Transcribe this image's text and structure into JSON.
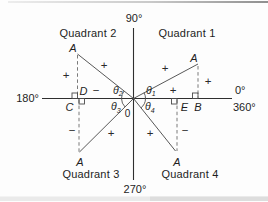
{
  "axes": {
    "top": "90°",
    "bottom": "270°",
    "left": "180°",
    "right_upper": "0°",
    "right_lower": "360°",
    "origin": "0"
  },
  "points": {
    "a": "A",
    "b": "B",
    "c": "C",
    "d": "D",
    "e": "E"
  },
  "quadrants": {
    "q1": {
      "label": "Quadrant 1",
      "angle_symbol": "θ",
      "angle_subscript": "1",
      "sign_hyp": "+",
      "sign_vertical": "+",
      "sign_horizontal": "+"
    },
    "q2": {
      "label": "Quadrant 2",
      "angle_symbol": "θ",
      "angle_subscript": "2",
      "sign_hyp": "+",
      "sign_vertical": "+",
      "sign_horizontal": "−"
    },
    "q3": {
      "label": "Quadrant 3",
      "angle_symbol": "θ",
      "angle_subscript": "3",
      "sign_hyp": "+",
      "sign_vertical": "−"
    },
    "q4": {
      "label": "Quadrant 4",
      "angle_symbol": "θ",
      "angle_subscript": "4",
      "sign_hyp": "+",
      "sign_vertical": "−"
    }
  },
  "colors": {
    "background": "#fdfdfd",
    "axis_line": "#2f2f2f",
    "diagonal_line": "#585858",
    "dashed_line": "#6b6b6b",
    "text": "#1e1e1e"
  }
}
